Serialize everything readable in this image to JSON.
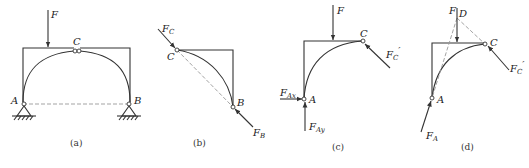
{
  "panels": [
    {
      "id": "a",
      "caption": "(a)",
      "labels": {
        "force": "F",
        "top_hinge": "C",
        "left_support": "A",
        "right_support": "B"
      }
    },
    {
      "id": "b",
      "caption": "(b)",
      "labels": {
        "point_c": "C",
        "point_b": "B",
        "force_c": "F",
        "force_c_sub": "C",
        "force_b": "F",
        "force_b_sub": "B"
      }
    },
    {
      "id": "c",
      "caption": "(c)",
      "labels": {
        "force": "F",
        "point_c": "C",
        "point_a": "A",
        "force_ax": "F",
        "force_ax_sub": "Ax",
        "force_ay": "F",
        "force_ay_sub": "Ay",
        "force_c": "F",
        "force_c_sub": "C",
        "force_c_prime": "′"
      }
    },
    {
      "id": "d",
      "caption": "(d)",
      "labels": {
        "force": "F",
        "point_d": "D",
        "point_c": "C",
        "point_a": "A",
        "force_a": "F",
        "force_a_sub": "A",
        "force_c": "F",
        "force_c_sub": "C",
        "force_c_prime": "′"
      }
    }
  ]
}
